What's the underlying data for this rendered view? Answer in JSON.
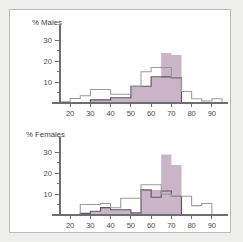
{
  "figure": {
    "background_color": "#eeeeec",
    "panel_background_color": "#ffffff",
    "panel_border_color": "#b9b9b7"
  },
  "colors": {
    "filled_series": "#c9b4c8",
    "outline_series": "#5d5560",
    "light_outline_series": "#9a9a9c",
    "axis": "#6e6e70",
    "text": "#3c3c3e"
  },
  "chart_data": [
    {
      "type": "bar",
      "title": "% Males",
      "xlabel": "Age",
      "ylabel": "",
      "xlim": [
        15,
        95
      ],
      "ylim": [
        0,
        34
      ],
      "xticks": [
        20,
        30,
        40,
        50,
        60,
        70,
        80,
        90
      ],
      "yticks": [
        10,
        20,
        30
      ],
      "yticks_minor": [
        5,
        15,
        25
      ],
      "grid": false,
      "legend": "none",
      "bin_edges": [
        15,
        20,
        25,
        30,
        35,
        40,
        45,
        50,
        55,
        60,
        65,
        70,
        75,
        80,
        85,
        90,
        95
      ],
      "categories": [
        "15-20",
        "20-25",
        "25-30",
        "30-35",
        "35-40",
        "40-45",
        "45-50",
        "50-55",
        "55-60",
        "60-65",
        "65-70",
        "70-75",
        "75-80",
        "80-85",
        "85-90",
        "90-95"
      ],
      "series": [
        {
          "name": "shaded",
          "style": "filled",
          "color": "#c9b4c8",
          "values": [
            0,
            0,
            0,
            1.5,
            1.5,
            2.5,
            2.5,
            8,
            8,
            12,
            24,
            23,
            0,
            0,
            0,
            0
          ]
        },
        {
          "name": "outline",
          "style": "step-outline",
          "color": "#5d5560",
          "values": [
            0,
            0,
            0,
            1.5,
            1.5,
            2.5,
            2.5,
            8,
            8,
            12.5,
            12.5,
            12,
            0,
            0,
            0,
            0
          ]
        },
        {
          "name": "light-outline",
          "style": "step-outline",
          "color": "#9a9a9c",
          "values": [
            0.6,
            2.2,
            3.5,
            6.5,
            6.5,
            4.2,
            4.2,
            8,
            15,
            17,
            17,
            12,
            5.5,
            2,
            1,
            2
          ]
        }
      ]
    },
    {
      "type": "bar",
      "title": "% Females",
      "xlabel": "Age",
      "ylabel": "",
      "xlim": [
        15,
        95
      ],
      "ylim": [
        0,
        34
      ],
      "xticks": [
        20,
        30,
        40,
        50,
        60,
        70,
        80,
        90
      ],
      "yticks": [
        10,
        20,
        30
      ],
      "yticks_minor": [
        5,
        15,
        25
      ],
      "grid": false,
      "legend": "none",
      "bin_edges": [
        15,
        20,
        25,
        30,
        35,
        40,
        45,
        50,
        55,
        60,
        65,
        70,
        75,
        80,
        85,
        90,
        95
      ],
      "categories": [
        "15-20",
        "20-25",
        "25-30",
        "30-35",
        "35-40",
        "40-45",
        "45-50",
        "50-55",
        "55-60",
        "60-65",
        "65-70",
        "70-75",
        "75-80",
        "80-85",
        "85-90",
        "90-95"
      ],
      "series": [
        {
          "name": "shaded",
          "style": "filled",
          "color": "#c9b4c8",
          "values": [
            0,
            0,
            0.8,
            1.8,
            3.5,
            2.5,
            2.5,
            1,
            12,
            12,
            29,
            24,
            0,
            0,
            0,
            0
          ]
        },
        {
          "name": "outline",
          "style": "step-outline",
          "color": "#5d5560",
          "values": [
            0,
            0,
            0.8,
            1.8,
            3.5,
            2.5,
            2.5,
            1,
            12,
            8.5,
            11.5,
            9,
            0,
            0,
            0,
            0
          ]
        },
        {
          "name": "light-outline",
          "style": "step-outline",
          "color": "#9a9a9c",
          "values": [
            0,
            0,
            5,
            5,
            5.5,
            3.5,
            8,
            8,
            14.5,
            14.5,
            10,
            9,
            9,
            4.5,
            5.5,
            0
          ]
        }
      ]
    }
  ]
}
